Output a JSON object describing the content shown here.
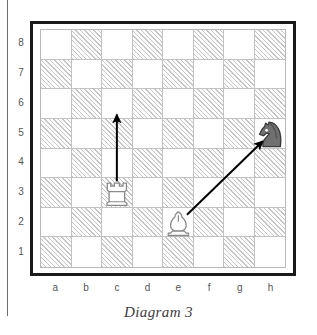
{
  "caption": "Diagram 3",
  "board": {
    "files": [
      "a",
      "b",
      "c",
      "d",
      "e",
      "f",
      "g",
      "h"
    ],
    "ranks": [
      "8",
      "7",
      "6",
      "5",
      "4",
      "3",
      "2",
      "1"
    ],
    "light_color": "#ffffff",
    "dark_color": "#c6c6c6",
    "frame_color": "#1a1a1a",
    "grid_line_color": "#c2c2c2"
  },
  "pieces": [
    {
      "name": "rook",
      "color": "white",
      "square": "c3",
      "glyph": "♖"
    },
    {
      "name": "bishop",
      "color": "white",
      "square": "e2",
      "glyph": "♗"
    },
    {
      "name": "knight",
      "color": "black",
      "square": "h5",
      "glyph": "♞"
    }
  ],
  "arrows": [
    {
      "name": "rook-move-arrow",
      "from": "c3",
      "to": "c6",
      "color": "#000000"
    },
    {
      "name": "bishop-capture-arrow",
      "from": "e2",
      "to": "h5",
      "color": "#000000"
    }
  ],
  "chart_data": {
    "type": "table",
    "title": "Diagram 3",
    "xlabel": "files",
    "ylabel": "ranks",
    "categories": [
      "a",
      "b",
      "c",
      "d",
      "e",
      "f",
      "g",
      "h"
    ],
    "values": [
      8,
      7,
      6,
      5,
      4,
      3,
      2,
      1
    ],
    "annotations": [
      "White rook on c3 moves vertically to c6",
      "White bishop on e2 captures along the diagonal to the black knight on h5"
    ]
  }
}
